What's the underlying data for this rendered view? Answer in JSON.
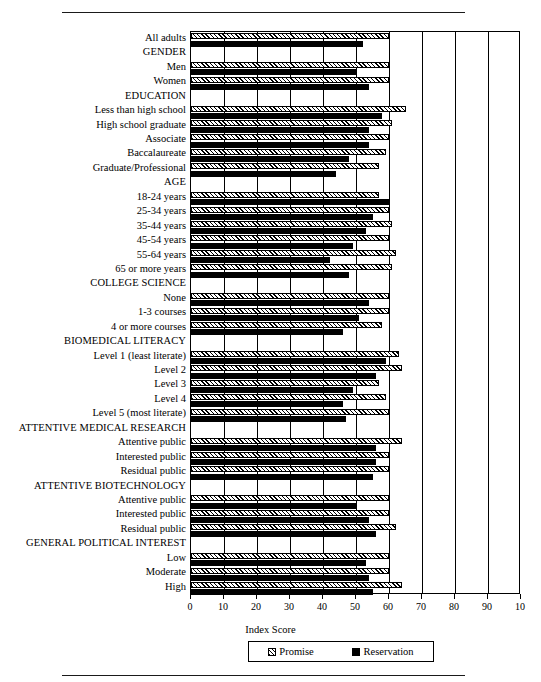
{
  "figure": {
    "axis_title": "Index Score",
    "legend": [
      {
        "key": "promise",
        "label": "Promise"
      },
      {
        "key": "reservation",
        "label": "Reservation"
      }
    ],
    "colors": {
      "promise": "#e8e8e8",
      "reservation": "#000000",
      "axis": "#000000",
      "background": "#ffffff"
    }
  },
  "chart_data": {
    "type": "bar",
    "orientation": "horizontal",
    "title": "",
    "xlabel": "Index Score",
    "ylabel": "",
    "xlim": [
      0,
      100
    ],
    "xticks": [
      0,
      10,
      20,
      30,
      40,
      50,
      60,
      70,
      80,
      90,
      100
    ],
    "xticklabels": [
      "0",
      "10",
      "20",
      "30",
      "40",
      "50",
      "60",
      "70",
      "80",
      "90",
      "10"
    ],
    "grid": true,
    "legend_position": "bottom",
    "series": [
      {
        "name": "Promise",
        "key": "promise"
      },
      {
        "name": "Reservation",
        "key": "reservation"
      }
    ],
    "categories": [
      "All adults",
      "GENDER",
      "Men",
      "Women",
      "EDUCATION",
      "Less than high school",
      "High school graduate",
      "Associate",
      "Baccalaureate",
      "Graduate/Professional",
      "AGE",
      "18-24 years",
      "25-34 years",
      "35-44 years",
      "45-54 years",
      "55-64 years",
      "65 or more years",
      "COLLEGE SCIENCE",
      "None",
      "1-3 courses",
      "4 or more courses",
      "BIOMEDICAL LITERACY",
      "Level 1 (least literate)",
      "Level 2",
      "Level 3",
      "Level 4",
      "Level 5 (most literate)",
      "ATTENTIVE MEDICAL RESEARCH",
      "Attentive public",
      "Interested public",
      "Residual public",
      "ATTENTIVE BIOTECHNOLOGY",
      "Attentive public",
      "Interested public",
      "Residual public",
      "GENERAL POLITICAL INTEREST",
      "Low",
      "Moderate",
      "High"
    ],
    "rows": [
      {
        "label": "All adults",
        "heading": false,
        "promise": 60,
        "reservation": 52
      },
      {
        "label": "GENDER",
        "heading": true,
        "promise": null,
        "reservation": null
      },
      {
        "label": "Men",
        "heading": false,
        "promise": 60,
        "reservation": 50
      },
      {
        "label": "Women",
        "heading": false,
        "promise": 60,
        "reservation": 54
      },
      {
        "label": "EDUCATION",
        "heading": true,
        "promise": null,
        "reservation": null
      },
      {
        "label": "Less than high school",
        "heading": false,
        "promise": 65,
        "reservation": 58
      },
      {
        "label": "High school graduate",
        "heading": false,
        "promise": 61,
        "reservation": 54
      },
      {
        "label": "Associate",
        "heading": false,
        "promise": 60,
        "reservation": 54
      },
      {
        "label": "Baccalaureate",
        "heading": false,
        "promise": 59,
        "reservation": 48
      },
      {
        "label": "Graduate/Professional",
        "heading": false,
        "promise": 57,
        "reservation": 44
      },
      {
        "label": "AGE",
        "heading": true,
        "promise": null,
        "reservation": null
      },
      {
        "label": "18-24 years",
        "heading": false,
        "promise": 57,
        "reservation": 60
      },
      {
        "label": "25-34 years",
        "heading": false,
        "promise": 60,
        "reservation": 55
      },
      {
        "label": "35-44 years",
        "heading": false,
        "promise": 61,
        "reservation": 53
      },
      {
        "label": "45-54 years",
        "heading": false,
        "promise": 60,
        "reservation": 49
      },
      {
        "label": "55-64 years",
        "heading": false,
        "promise": 62,
        "reservation": 42
      },
      {
        "label": "65 or more years",
        "heading": false,
        "promise": 61,
        "reservation": 48
      },
      {
        "label": "COLLEGE SCIENCE",
        "heading": true,
        "promise": null,
        "reservation": null
      },
      {
        "label": "None",
        "heading": false,
        "promise": 60,
        "reservation": 54
      },
      {
        "label": "1-3 courses",
        "heading": false,
        "promise": 60,
        "reservation": 51
      },
      {
        "label": "4 or more courses",
        "heading": false,
        "promise": 58,
        "reservation": 46
      },
      {
        "label": "BIOMEDICAL LITERACY",
        "heading": true,
        "promise": null,
        "reservation": null
      },
      {
        "label": "Level 1 (least literate)",
        "heading": false,
        "promise": 63,
        "reservation": 59
      },
      {
        "label": "Level 2",
        "heading": false,
        "promise": 64,
        "reservation": 56
      },
      {
        "label": "Level 3",
        "heading": false,
        "promise": 57,
        "reservation": 49
      },
      {
        "label": "Level 4",
        "heading": false,
        "promise": 59,
        "reservation": 46
      },
      {
        "label": "Level 5 (most literate)",
        "heading": false,
        "promise": 60,
        "reservation": 47
      },
      {
        "label": "ATTENTIVE MEDICAL RESEARCH",
        "heading": true,
        "promise": null,
        "reservation": null
      },
      {
        "label": "Attentive public",
        "heading": false,
        "promise": 64,
        "reservation": 56
      },
      {
        "label": "Interested public",
        "heading": false,
        "promise": 60,
        "reservation": 56
      },
      {
        "label": "Residual public",
        "heading": false,
        "promise": 60,
        "reservation": 55
      },
      {
        "label": "ATTENTIVE BIOTECHNOLOGY",
        "heading": true,
        "promise": null,
        "reservation": null
      },
      {
        "label": "Attentive public",
        "heading": false,
        "promise": 60,
        "reservation": 50
      },
      {
        "label": "Interested public",
        "heading": false,
        "promise": 60,
        "reservation": 54
      },
      {
        "label": "Residual public",
        "heading": false,
        "promise": 62,
        "reservation": 56
      },
      {
        "label": "GENERAL POLITICAL INTEREST",
        "heading": true,
        "promise": null,
        "reservation": null
      },
      {
        "label": "Low",
        "heading": false,
        "promise": 60,
        "reservation": 53
      },
      {
        "label": "Moderate",
        "heading": false,
        "promise": 60,
        "reservation": 54
      },
      {
        "label": "High",
        "heading": false,
        "promise": 64,
        "reservation": 55
      }
    ]
  }
}
